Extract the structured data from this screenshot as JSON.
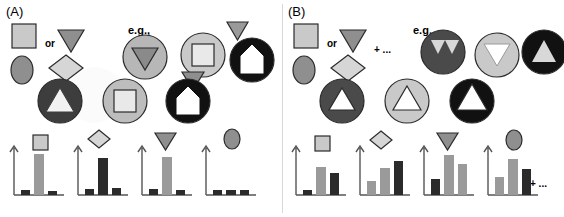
{
  "figure": {
    "panels": [
      {
        "id": "A",
        "label": "(A)",
        "or_label": "or",
        "eg_label": "e.g.,",
        "plus_label": "",
        "shapes_legend": [
          {
            "name": "square",
            "fill": "#c9c9c9"
          },
          {
            "name": "triangle-down",
            "fill": "#8f8f8f"
          },
          {
            "name": "ellipse",
            "fill": "#8f8f8f"
          },
          {
            "name": "diamond",
            "fill": "#d6d6d6"
          }
        ],
        "composites": [
          {
            "name": "circle-gray-with-triangle",
            "circle_fill": "#c9c9c9",
            "inner": "triangle-down",
            "inner_fill": "#8f8f8f"
          },
          {
            "name": "circle-gray-with-square",
            "circle_fill": "#c9c9c9",
            "inner": "square",
            "inner_fill": "#e6e6e6"
          },
          {
            "name": "circle-dark-with-triangle-up",
            "circle_fill": "#3a3a3a",
            "inner": "triangle-up",
            "inner_fill": "#f2f2f2"
          },
          {
            "name": "circle-dark-with-triangle-down",
            "circle_fill": "#6b6b6b",
            "inner": "triangle-down",
            "inner_fill": "#d0d0d0"
          },
          {
            "name": "circle-black-with-house",
            "circle_fill": "#111111",
            "inner": "house",
            "inner_fill": "#ffffff"
          },
          {
            "name": "triangle-gray-top",
            "fill": "#9a9a9a"
          },
          {
            "name": "triangle-gray-side",
            "fill": "#8f8f8f"
          }
        ],
        "charts": [
          {
            "name": "chart-square",
            "icon": "square",
            "icon_fill": "#c9c9c9",
            "bars": [
              {
                "value": 0.1,
                "color": "#2b2b2b"
              },
              {
                "value": 0.88,
                "color": "#9a9a9a"
              },
              {
                "value": 0.08,
                "color": "#2b2b2b"
              }
            ]
          },
          {
            "name": "chart-diamond",
            "icon": "diamond",
            "icon_fill": "#d6d6d6",
            "bars": [
              {
                "value": 0.12,
                "color": "#2b2b2b"
              },
              {
                "value": 0.8,
                "color": "#2b2b2b"
              },
              {
                "value": 0.16,
                "color": "#2b2b2b"
              }
            ]
          },
          {
            "name": "chart-triangle",
            "icon": "triangle-down",
            "icon_fill": "#8f8f8f",
            "bars": [
              {
                "value": 0.12,
                "color": "#2b2b2b"
              },
              {
                "value": 0.82,
                "color": "#9a9a9a"
              },
              {
                "value": 0.1,
                "color": "#2b2b2b"
              }
            ]
          },
          {
            "name": "chart-ellipse",
            "icon": "ellipse",
            "icon_fill": "#8f8f8f",
            "bars": [
              {
                "value": 0.1,
                "color": "#2b2b2b"
              },
              {
                "value": 0.09,
                "color": "#2b2b2b"
              },
              {
                "value": 0.1,
                "color": "#2b2b2b"
              }
            ]
          }
        ]
      },
      {
        "id": "B",
        "label": "(B)",
        "or_label": "or",
        "eg_label": "e.g.,",
        "plus_label": "+ ...",
        "plus_label_charts": "+ ...",
        "shapes_legend": [
          {
            "name": "square",
            "fill": "#c9c9c9"
          },
          {
            "name": "triangle-down",
            "fill": "#8f8f8f"
          },
          {
            "name": "ellipse",
            "fill": "#8f8f8f"
          },
          {
            "name": "diamond",
            "fill": "#d6d6d6"
          }
        ],
        "composites": [
          {
            "name": "circle-dark-with-triangles",
            "circle_fill": "#4a4a4a",
            "inner": "triangle-pair",
            "inner_fill": "#d8d8d8"
          },
          {
            "name": "circle-gray-with-triangle-notch",
            "circle_fill": "#c9c9c9",
            "inner": "triangle-down",
            "inner_fill": "#8f8f8f"
          },
          {
            "name": "circle-black-with-triangle-up",
            "circle_fill": "#111111",
            "inner": "triangle-up",
            "inner_fill": "#d8d8d8"
          },
          {
            "name": "crescent-dark",
            "fill": "#4a4a4a"
          },
          {
            "name": "crescent-gray",
            "fill": "#c9c9c9"
          },
          {
            "name": "crescent-black",
            "fill": "#111111"
          }
        ],
        "charts": [
          {
            "name": "chart-square",
            "icon": "square",
            "icon_fill": "#c9c9c9",
            "bars": [
              {
                "value": 0.1,
                "color": "#2b2b2b"
              },
              {
                "value": 0.6,
                "color": "#9a9a9a"
              },
              {
                "value": 0.46,
                "color": "#2b2b2b"
              }
            ]
          },
          {
            "name": "chart-diamond",
            "icon": "diamond",
            "icon_fill": "#d6d6d6",
            "bars": [
              {
                "value": 0.3,
                "color": "#9a9a9a"
              },
              {
                "value": 0.58,
                "color": "#9a9a9a"
              },
              {
                "value": 0.72,
                "color": "#2b2b2b"
              }
            ]
          },
          {
            "name": "chart-triangle",
            "icon": "triangle-down",
            "icon_fill": "#8f8f8f",
            "bars": [
              {
                "value": 0.34,
                "color": "#2b2b2b"
              },
              {
                "value": 0.86,
                "color": "#9a9a9a"
              },
              {
                "value": 0.66,
                "color": "#9a9a9a"
              }
            ]
          },
          {
            "name": "chart-ellipse",
            "icon": "ellipse",
            "icon_fill": "#8f8f8f",
            "bars": [
              {
                "value": 0.4,
                "color": "#9a9a9a"
              },
              {
                "value": 0.78,
                "color": "#9a9a9a"
              },
              {
                "value": 0.56,
                "color": "#2b2b2b"
              }
            ]
          }
        ]
      }
    ]
  }
}
